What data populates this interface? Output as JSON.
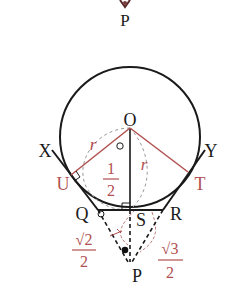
{
  "colors": {
    "black": "#1a1a1a",
    "red": "#b0504f",
    "grey_dash": "#9a9a9a"
  },
  "points": {
    "P_top": "P",
    "O": "O",
    "X": "X",
    "Y": "Y",
    "U": "U",
    "T": "T",
    "Q": "Q",
    "S": "S",
    "R": "R",
    "P": "P"
  },
  "annotations": {
    "r_left": "r",
    "r_right": "r",
    "half_num": "1",
    "half_den": "2",
    "sqrt2_num": "√2",
    "sqrt2_den": "2",
    "sqrt3_num": "√3",
    "sqrt3_den": "2"
  }
}
